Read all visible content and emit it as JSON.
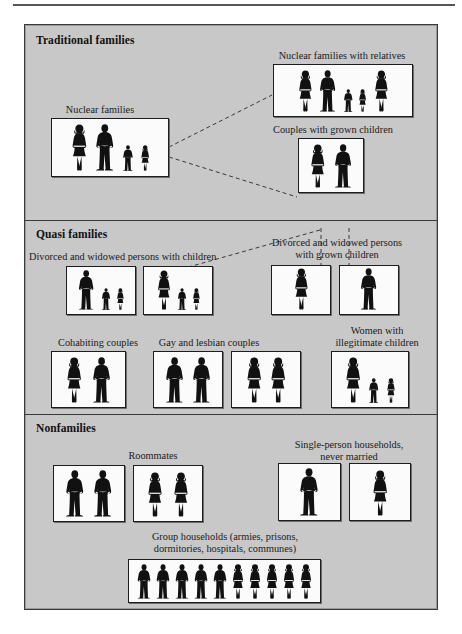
{
  "figure": {
    "background_color": "#c8c8c8",
    "box_fill_color": "#fbfbfb",
    "silhouette_color": "#111111",
    "sections": [
      {
        "id": "traditional",
        "title": "Traditional families"
      },
      {
        "id": "quasi",
        "title": "Quasi families"
      },
      {
        "id": "nonfamilies",
        "title": "Nonfamilies"
      }
    ],
    "groups": [
      {
        "id": "nuclear-families",
        "section": "traditional",
        "caption": "Nuclear families",
        "boxes": [
          {
            "figures": [
              "woman",
              "man",
              "boy",
              "girl"
            ]
          }
        ]
      },
      {
        "id": "nuclear-families-with-relatives",
        "section": "traditional",
        "caption": "Nuclear families with relatives",
        "boxes": [
          {
            "figures": [
              "woman",
              "man",
              "boy",
              "girl",
              "woman"
            ]
          }
        ]
      },
      {
        "id": "couples-with-grown-children",
        "section": "traditional",
        "caption": "Couples with grown children",
        "boxes": [
          {
            "figures": [
              "woman",
              "man"
            ]
          }
        ]
      },
      {
        "id": "divorced-widowed-with-children",
        "section": "quasi",
        "caption": "Divorced and widowed persons with children",
        "boxes": [
          {
            "figures": [
              "man",
              "boy",
              "girl"
            ]
          },
          {
            "figures": [
              "woman",
              "boy",
              "girl"
            ]
          }
        ]
      },
      {
        "id": "divorced-widowed-grown-children",
        "section": "quasi",
        "caption": "Divorced and widowed persons\nwith grown children",
        "boxes": [
          {
            "figures": [
              "woman"
            ]
          },
          {
            "figures": [
              "man"
            ]
          }
        ]
      },
      {
        "id": "cohabiting-couples",
        "section": "quasi",
        "caption": "Cohabiting couples",
        "boxes": [
          {
            "figures": [
              "woman",
              "man"
            ]
          }
        ]
      },
      {
        "id": "gay-and-lesbian-couples",
        "section": "quasi",
        "caption": "Gay and lesbian couples",
        "boxes": [
          {
            "figures": [
              "man",
              "man"
            ]
          },
          {
            "figures": [
              "woman",
              "woman"
            ]
          }
        ]
      },
      {
        "id": "women-with-illegitimate-children",
        "section": "quasi",
        "caption": "Women with\nillegitimate children",
        "boxes": [
          {
            "figures": [
              "woman",
              "boy",
              "girl"
            ]
          }
        ]
      },
      {
        "id": "roommates",
        "section": "nonfamilies",
        "caption": "Roommates",
        "boxes": [
          {
            "figures": [
              "man",
              "man"
            ]
          },
          {
            "figures": [
              "woman",
              "woman"
            ]
          }
        ]
      },
      {
        "id": "single-person-households",
        "section": "nonfamilies",
        "caption": "Single-person households,\nnever married",
        "boxes": [
          {
            "figures": [
              "man"
            ]
          },
          {
            "figures": [
              "woman"
            ]
          }
        ]
      },
      {
        "id": "group-households",
        "section": "nonfamilies",
        "caption": "Group households (armies, prisons,\ndormitories, hospitals, communes)",
        "boxes": [
          {
            "figures": [
              "man",
              "man",
              "man",
              "man",
              "man",
              "woman",
              "woman",
              "woman",
              "woman",
              "woman"
            ]
          }
        ]
      }
    ],
    "connectors": [
      {
        "from": "nuclear-families",
        "to": "nuclear-families-with-relatives",
        "style": "dashed"
      },
      {
        "from": "nuclear-families",
        "to": "couples-with-grown-children",
        "style": "dashed"
      },
      {
        "from": "couples-with-grown-children",
        "to": "divorced-widowed-with-children",
        "style": "dashed"
      },
      {
        "from": "couples-with-grown-children",
        "to": "divorced-widowed-grown-children",
        "style": "dashed"
      }
    ]
  }
}
